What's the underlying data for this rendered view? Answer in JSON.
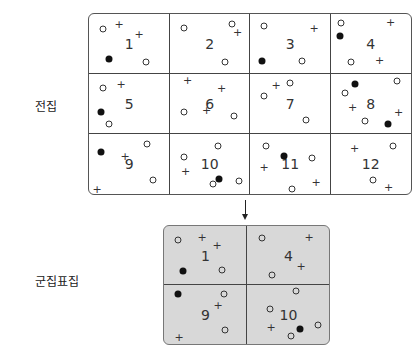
{
  "labels": {
    "population": "전집",
    "cluster_sample": "군집표집"
  },
  "grid": {
    "cells": [
      {
        "n": "1",
        "items": [
          [
            "o",
            14,
            15
          ],
          [
            "+",
            30,
            10
          ],
          [
            "+",
            50,
            20
          ],
          [
            "dot",
            20,
            45
          ],
          [
            "o",
            57,
            48
          ]
        ]
      },
      {
        "n": "2",
        "items": [
          [
            "o",
            14,
            14
          ],
          [
            "o",
            62,
            10
          ],
          [
            "+",
            68,
            18
          ],
          [
            "o",
            55,
            48
          ]
        ]
      },
      {
        "n": "3",
        "items": [
          [
            "o",
            14,
            12
          ],
          [
            "+",
            64,
            14
          ],
          [
            "dot",
            12,
            47
          ],
          [
            "o",
            52,
            47
          ]
        ]
      },
      {
        "n": "4",
        "items": [
          [
            "o",
            10,
            9
          ],
          [
            "+",
            60,
            8
          ],
          [
            "dot",
            9,
            22
          ],
          [
            "o",
            20,
            48
          ],
          [
            "+",
            49,
            46
          ]
        ]
      },
      {
        "n": "5",
        "items": [
          [
            "o",
            14,
            14
          ],
          [
            "+",
            32,
            10
          ],
          [
            "dot",
            12,
            38
          ],
          [
            "o",
            20,
            50
          ]
        ]
      },
      {
        "n": "6",
        "items": [
          [
            "+",
            18,
            6
          ],
          [
            "+",
            52,
            14
          ],
          [
            "o",
            14,
            38
          ],
          [
            "+",
            37,
            36
          ],
          [
            "o",
            64,
            42
          ]
        ]
      },
      {
        "n": "7",
        "items": [
          [
            "+",
            26,
            11
          ],
          [
            "o",
            40,
            9
          ],
          [
            "o",
            14,
            22
          ],
          [
            "o",
            56,
            46
          ]
        ]
      },
      {
        "n": "8",
        "items": [
          [
            "dot",
            24,
            10
          ],
          [
            "o",
            66,
            7
          ],
          [
            "o",
            14,
            19
          ],
          [
            "+",
            22,
            33
          ],
          [
            "+",
            68,
            38
          ],
          [
            "o",
            34,
            47
          ],
          [
            "dot",
            57,
            50
          ]
        ]
      },
      {
        "n": "9",
        "items": [
          [
            "dot",
            12,
            18
          ],
          [
            "+",
            36,
            22
          ],
          [
            "o",
            58,
            10
          ],
          [
            "o",
            64,
            46
          ],
          [
            "+",
            8,
            55
          ]
        ]
      },
      {
        "n": "10",
        "items": [
          [
            "o",
            48,
            12
          ],
          [
            "o",
            14,
            23
          ],
          [
            "+",
            16,
            37
          ],
          [
            "o",
            43,
            50
          ],
          [
            "dot",
            49,
            45
          ],
          [
            "o",
            69,
            47
          ]
        ]
      },
      {
        "n": "11",
        "items": [
          [
            "o",
            16,
            12
          ],
          [
            "dot",
            34,
            22
          ],
          [
            "o",
            62,
            24
          ],
          [
            "+",
            14,
            33
          ],
          [
            "o",
            42,
            55
          ],
          [
            "+",
            66,
            48
          ]
        ]
      },
      {
        "n": "12",
        "items": [
          [
            "+",
            24,
            14
          ],
          [
            "o",
            62,
            12
          ],
          [
            "o",
            42,
            46
          ],
          [
            "+",
            58,
            53
          ]
        ]
      }
    ]
  },
  "cluster": {
    "cells": [
      {
        "n": "1",
        "items": [
          [
            "o",
            14,
            14
          ],
          [
            "+",
            38,
            11
          ],
          [
            "+",
            53,
            19
          ],
          [
            "dot",
            19,
            45
          ],
          [
            "o",
            58,
            44
          ]
        ]
      },
      {
        "n": "4",
        "items": [
          [
            "o",
            15,
            12
          ],
          [
            "+",
            62,
            11
          ],
          [
            "+",
            54,
            40
          ],
          [
            "o",
            25,
            49
          ]
        ]
      },
      {
        "n": "9",
        "items": [
          [
            "dot",
            14,
            9
          ],
          [
            "o",
            60,
            9
          ],
          [
            "+",
            54,
            20
          ],
          [
            "o",
            61,
            45
          ],
          [
            "+",
            15,
            52
          ]
        ]
      },
      {
        "n": "10",
        "items": [
          [
            "o",
            49,
            6
          ],
          [
            "o",
            23,
            24
          ],
          [
            "+",
            24,
            42
          ],
          [
            "dot",
            53,
            44
          ],
          [
            "o",
            44,
            51
          ],
          [
            "o",
            71,
            40
          ]
        ]
      }
    ]
  }
}
